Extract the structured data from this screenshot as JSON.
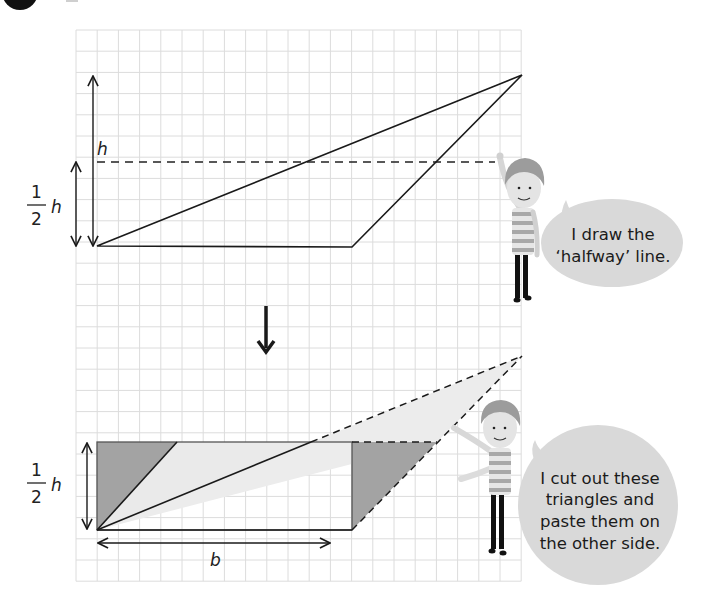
{
  "step_badge": {
    "icon": "step-number-circle"
  },
  "grid": {
    "x0": 76,
    "y0": 30,
    "cell": 21.2,
    "cols": 21,
    "rows": 26,
    "line_color": "#dcdcdc"
  },
  "top_diagram": {
    "height_label": "h",
    "half_height_label": {
      "numerator": "1",
      "denominator": "2",
      "variable": "h"
    },
    "triangle": {
      "A": [
        97,
        246
      ],
      "B": [
        352,
        246
      ],
      "C": [
        522,
        75
      ]
    },
    "halfway_line_y": 161
  },
  "arrow_down": {
    "icon": "down-arrow-icon"
  },
  "bottom_diagram": {
    "half_height_label": {
      "numerator": "1",
      "denominator": "2",
      "variable": "h"
    },
    "base_label": "b",
    "rectangle": {
      "left": 97,
      "top": 442,
      "right": 352,
      "bottom": 530
    },
    "ghost_apex": [
      522,
      356
    ],
    "cut_point_left": [
      177,
      442
    ],
    "cut_point_right": [
      437,
      442
    ]
  },
  "speech_bubbles": [
    {
      "lines": [
        "I draw the",
        "‘halfway’ line."
      ]
    },
    {
      "lines": [
        "I cut out these",
        "triangles and",
        "paste them on",
        "the other side."
      ]
    }
  ],
  "colors": {
    "ink": "#1a1a1a",
    "dark_fill": "#9a9a9a",
    "light_fill": "#e9e9e9",
    "bubble": "#d9d9d9",
    "hair": "#9b9b9b",
    "skin": "#e2e2e2",
    "stripe_dark": "#a9a9a9",
    "stripe_light": "#ececec",
    "legs": "#111111"
  }
}
